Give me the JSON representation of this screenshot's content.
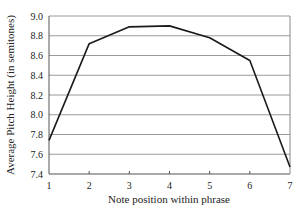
{
  "chart_data": {
    "type": "line",
    "title": "",
    "xlabel": "Note position within phrase",
    "ylabel": "Average Pitch Height (in semitones)",
    "x": [
      1,
      2,
      3,
      4,
      5,
      6,
      7
    ],
    "categories": [
      "1",
      "2",
      "3",
      "4",
      "5",
      "6",
      "7"
    ],
    "series": [
      {
        "name": "Average Pitch Height",
        "values": [
          7.74,
          8.72,
          8.89,
          8.9,
          8.78,
          8.55,
          7.47
        ]
      }
    ],
    "ylim": [
      7.4,
      9.0
    ],
    "yticks": [
      7.4,
      7.6,
      7.8,
      8.0,
      8.2,
      8.4,
      8.6,
      8.8,
      9.0
    ],
    "ytick_labels": [
      "7.4",
      "7.6",
      "7.8",
      "8.0",
      "8.2",
      "8.4",
      "8.6",
      "8.8",
      "9.0"
    ],
    "xlim": [
      1,
      7
    ],
    "grid": {
      "horizontal": true,
      "vertical": false
    },
    "legend": null,
    "colors": {
      "line": "#1a1a1a",
      "grid": "#9a9a9a",
      "axis": "#555555",
      "frame": "#888888"
    }
  }
}
